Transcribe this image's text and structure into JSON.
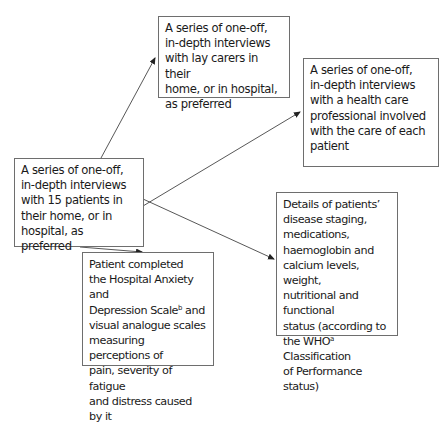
{
  "diagram": {
    "type": "flow",
    "nodes": [
      {
        "id": "patients",
        "lines": [
          "A series of one-off,",
          "in-depth interviews",
          "with 15 patients in",
          "their home, or in",
          "hospital, as preferred"
        ]
      },
      {
        "id": "lay_carers",
        "lines": [
          "A series of one-off,",
          "in-depth interviews",
          "with lay carers in their",
          "home, or in hospital,",
          "as preferred"
        ]
      },
      {
        "id": "health_professional",
        "lines": [
          "A series of one-off,",
          "in-depth interviews",
          "with a health care",
          "professional involved",
          "with the care of each",
          "patient"
        ]
      },
      {
        "id": "patient_details",
        "lines": [
          "Details of patients’",
          "disease staging,",
          "medications,",
          "haemoglobin and",
          "calcium levels, weight,",
          "nutritional and functional",
          "status (according to"
        ],
        "line_last_prefix": "the WHO",
        "line_last_sup": "a",
        "line_last_suffix": " Classification",
        "line_final": "of Performance status)"
      },
      {
        "id": "questionnaires",
        "lines": [
          "Patient completed",
          "the Hospital Anxiety and"
        ],
        "line3_prefix": "Depression Scale",
        "line3_sup": "b",
        "line3_suffix": " and",
        "lines_after": [
          "visual analogue scales",
          "measuring perceptions of",
          "pain, severity of fatigue",
          "and distress caused by it"
        ]
      }
    ],
    "edges": [
      {
        "from": "patients",
        "to": "lay_carers"
      },
      {
        "from": "patients",
        "to": "health_professional"
      },
      {
        "from": "patients",
        "to": "patient_details"
      },
      {
        "from": "patients",
        "to": "questionnaires"
      }
    ]
  }
}
